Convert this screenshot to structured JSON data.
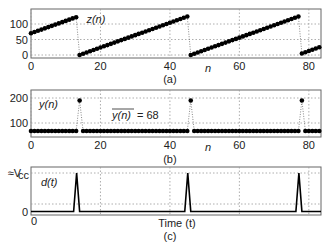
{
  "chart_data": [
    {
      "id": "a",
      "type": "scatter",
      "caption": "(a)",
      "series_label": "z(n)",
      "xlabel": "n",
      "ylabel": "",
      "xlim": [
        0,
        83
      ],
      "ylim": [
        -5,
        140
      ],
      "xticks": [
        0,
        20,
        40,
        60,
        80
      ],
      "yticks": [
        0,
        50,
        100
      ],
      "grid": true,
      "description": "Sawtooth: rises ~4 per sample, wraps at ~128",
      "x": [
        0,
        1,
        2,
        3,
        4,
        5,
        6,
        7,
        8,
        9,
        10,
        11,
        12,
        13,
        14,
        15,
        16,
        17,
        18,
        19,
        20,
        21,
        22,
        23,
        24,
        25,
        26,
        27,
        28,
        29,
        30,
        31,
        32,
        33,
        34,
        35,
        36,
        37,
        38,
        39,
        40,
        41,
        42,
        43,
        44,
        45,
        46,
        47,
        48,
        49,
        50,
        51,
        52,
        53,
        54,
        55,
        56,
        57,
        58,
        59,
        60,
        61,
        62,
        63,
        64,
        65,
        66,
        67,
        68,
        69,
        70,
        71,
        72,
        73,
        74,
        75,
        76,
        77,
        78,
        79,
        80,
        81,
        82,
        83
      ],
      "values": [
        70,
        74,
        78,
        82,
        86,
        90,
        94,
        98,
        102,
        106,
        110,
        114,
        118,
        122,
        0,
        4,
        8,
        12,
        16,
        20,
        24,
        28,
        32,
        36,
        40,
        44,
        48,
        52,
        56,
        60,
        64,
        68,
        72,
        76,
        80,
        84,
        88,
        92,
        96,
        100,
        104,
        108,
        112,
        116,
        120,
        124,
        0,
        4,
        8,
        12,
        16,
        20,
        24,
        28,
        32,
        36,
        40,
        44,
        48,
        52,
        56,
        60,
        64,
        68,
        72,
        76,
        80,
        84,
        88,
        92,
        96,
        100,
        104,
        108,
        112,
        116,
        120,
        124,
        5,
        9,
        13,
        17,
        21,
        25
      ]
    },
    {
      "id": "b",
      "type": "scatter",
      "caption": "(b)",
      "series_label": "y(n)",
      "annotation": "y(n) = 68",
      "annotation_overline": "y(n)",
      "annotation_value": "= 68",
      "xlabel": "n",
      "xlim": [
        0,
        83
      ],
      "ylim": [
        60,
        215
      ],
      "xticks": [
        0,
        20,
        40,
        60,
        80
      ],
      "yticks": [
        100,
        200
      ],
      "grid": true,
      "baseline": 68,
      "spikes": [
        {
          "n": 14,
          "value": 190
        },
        {
          "n": 46,
          "value": 190
        },
        {
          "n": 78,
          "value": 190
        }
      ],
      "mean": 68
    },
    {
      "id": "c",
      "type": "line",
      "caption": "(c)",
      "series_label": "d(t)",
      "xlabel": "Time (t)",
      "yticks": [
        "0",
        "≈V_cc"
      ],
      "ytick_main": "≈V",
      "ytick_sub": "cc",
      "ytick_zero": "0",
      "xtick_zero": "0",
      "grid": true,
      "pulses_at_n": [
        14,
        46,
        78
      ],
      "pulse_height": "≈Vcc"
    }
  ]
}
